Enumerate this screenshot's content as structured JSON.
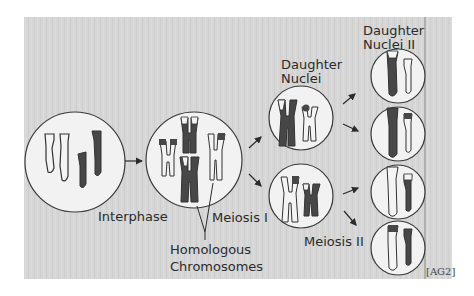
{
  "figure": {
    "background_color": "#d7d7d7",
    "dark_chromosome_color": "#474747",
    "light_chromosome_color": "#f4f4f4",
    "nucleus_fill": "#f2f2f2",
    "outline_color": "#3a3a3a"
  },
  "labels": {
    "interphase": "Interphase",
    "meiosis_1": "Meiosis I",
    "homologous_line1": "Homologous",
    "homologous_line2": "Chromosomes",
    "daughter_nuclei_line1": "Daughter",
    "daughter_nuclei_line2": "Nuclei",
    "daughter_nuclei_2_line1": "Daughter",
    "daughter_nuclei_2_line2": "Nuclei II",
    "meiosis_2": "Meiosis II",
    "source_tag": "[AG2]"
  },
  "stages": [
    {
      "name": "Interphase",
      "cells": 1
    },
    {
      "name": "Meiosis I",
      "cells": 1
    },
    {
      "name": "Daughter Nuclei",
      "cells": 2
    },
    {
      "name": "Daughter Nuclei II",
      "cells": 4
    }
  ]
}
